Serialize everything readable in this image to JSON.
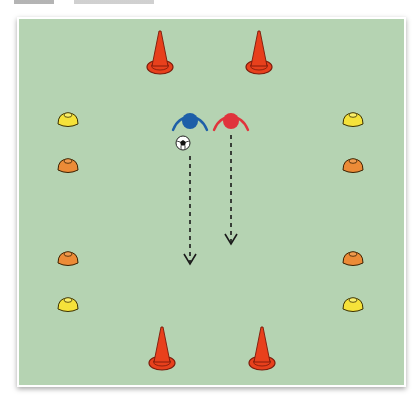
{
  "diagram": {
    "type": "soccer-drill",
    "pitch_color": "#b5d3b2",
    "colors": {
      "cone": "#e8401c",
      "cone_outline": "#7a1a0a",
      "marker_yellow": "#f5e23a",
      "marker_orange": "#ec8b37",
      "player_blue": "#1e5fa8",
      "player_red": "#e0343c",
      "path_line": "#1a1a1a"
    },
    "cones": [
      {
        "x": 160,
        "y": 55
      },
      {
        "x": 259,
        "y": 55
      },
      {
        "x": 162,
        "y": 343
      },
      {
        "x": 262,
        "y": 343
      }
    ],
    "markers": [
      {
        "x": 68,
        "y": 120,
        "color": "yellow"
      },
      {
        "x": 68,
        "y": 164,
        "color": "orange"
      },
      {
        "x": 68,
        "y": 258,
        "color": "orange"
      },
      {
        "x": 68,
        "y": 304,
        "color": "yellow"
      },
      {
        "x": 352,
        "y": 120,
        "color": "yellow"
      },
      {
        "x": 352,
        "y": 164,
        "color": "orange"
      },
      {
        "x": 352,
        "y": 258,
        "color": "orange"
      },
      {
        "x": 352,
        "y": 304,
        "color": "yellow"
      }
    ],
    "players": [
      {
        "team": "blue",
        "x": 190,
        "y": 120
      },
      {
        "team": "red",
        "x": 230,
        "y": 120
      }
    ],
    "ball": {
      "x": 183,
      "y": 143
    },
    "paths": [
      {
        "from": [
          190,
          155
        ],
        "to": [
          190,
          262
        ],
        "style": "dashed-arrow"
      },
      {
        "from": [
          231,
          135
        ],
        "to": [
          231,
          242
        ],
        "style": "dashed-arrow"
      }
    ]
  }
}
